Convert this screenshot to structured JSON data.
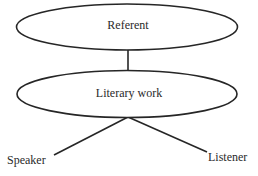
{
  "diagram": {
    "type": "hierarchy",
    "colors": {
      "stroke": "#262626",
      "text": "#2a2a2a",
      "background": "#ffffff"
    },
    "nodes": [
      {
        "id": "referent",
        "label": "Referent",
        "shape": "ellipse"
      },
      {
        "id": "literary-work",
        "label": "Literary work",
        "shape": "ellipse"
      },
      {
        "id": "speaker",
        "label": "Speaker",
        "shape": "text"
      },
      {
        "id": "listener",
        "label": "Listener",
        "shape": "text"
      }
    ],
    "edges": [
      {
        "from": "referent",
        "to": "literary-work"
      },
      {
        "from": "literary-work",
        "to": "speaker"
      },
      {
        "from": "literary-work",
        "to": "listener"
      }
    ],
    "caption_clipped": true
  }
}
